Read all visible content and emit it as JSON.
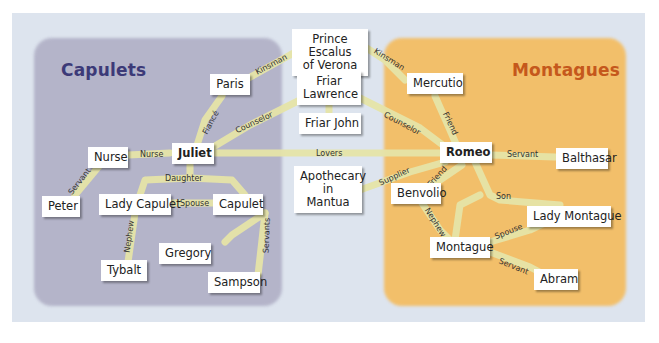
{
  "colors": {
    "panel": "#dde4ee",
    "capulets_region": "#b4b4c9",
    "montagues_region": "#f2bf6a",
    "capulets_title": "#3c3a78",
    "montagues_title": "#c5581c",
    "edge": "#e6e4a8"
  },
  "groups": {
    "capulets": {
      "label": "Capulets"
    },
    "montagues": {
      "label": "Montagues"
    }
  },
  "nodes": {
    "prince": {
      "label": "Prince Escalus\nof Verona"
    },
    "paris": {
      "label": "Paris"
    },
    "friar_lawrence": {
      "label": "Friar\nLawrence"
    },
    "friar_john": {
      "label": "Friar John"
    },
    "mercutio": {
      "label": "Mercutio"
    },
    "nurse": {
      "label": "Nurse"
    },
    "juliet": {
      "label": "Juliet"
    },
    "romeo": {
      "label": "Romeo"
    },
    "balthasar": {
      "label": "Balthasar"
    },
    "peter": {
      "label": "Peter"
    },
    "lady_capulet": {
      "label": "Lady Capulet"
    },
    "capulet": {
      "label": "Capulet"
    },
    "apothecary": {
      "label": "Apothecary\nin Mantua"
    },
    "benvolio": {
      "label": "Benvolio"
    },
    "lady_montague": {
      "label": "Lady Montague"
    },
    "gregory": {
      "label": "Gregory"
    },
    "tybalt": {
      "label": "Tybalt"
    },
    "montague": {
      "label": "Montague"
    },
    "sampson": {
      "label": "Sampson"
    },
    "abram": {
      "label": "Abram"
    }
  },
  "edges": [
    {
      "from": "paris",
      "to": "prince",
      "label": "Kinsman"
    },
    {
      "from": "prince",
      "to": "mercutio",
      "label": "Kinsman"
    },
    {
      "from": "juliet",
      "to": "paris",
      "label": "Fiancé"
    },
    {
      "from": "juliet",
      "to": "friar_lawrence",
      "label": "Counselor"
    },
    {
      "from": "friar_lawrence",
      "to": "romeo",
      "label": "Counselor"
    },
    {
      "from": "mercutio",
      "to": "romeo",
      "label": "Friend"
    },
    {
      "from": "nurse",
      "to": "juliet",
      "label": "Nurse"
    },
    {
      "from": "juliet",
      "to": "romeo",
      "label": "Lovers"
    },
    {
      "from": "romeo",
      "to": "balthasar",
      "label": "Servant"
    },
    {
      "from": "nurse",
      "to": "peter",
      "label": "Servant"
    },
    {
      "from": "juliet",
      "to": "capulet",
      "label": "Daughter"
    },
    {
      "from": "lady_capulet",
      "to": "capulet",
      "label": "Spouse"
    },
    {
      "from": "lady_capulet",
      "to": "tybalt",
      "label": "Nephew"
    },
    {
      "from": "capulet",
      "to": "sampson",
      "label": "Servants"
    },
    {
      "from": "apothecary",
      "to": "romeo",
      "label": "Supplier"
    },
    {
      "from": "romeo",
      "to": "benvolio",
      "label": "Friend"
    },
    {
      "from": "romeo",
      "to": "montague",
      "label": "Son"
    },
    {
      "from": "benvolio",
      "to": "montague",
      "label": "Nephew"
    },
    {
      "from": "montague",
      "to": "lady_montague",
      "label": "Spouse"
    },
    {
      "from": "montague",
      "to": "abram",
      "label": "Servant"
    }
  ]
}
